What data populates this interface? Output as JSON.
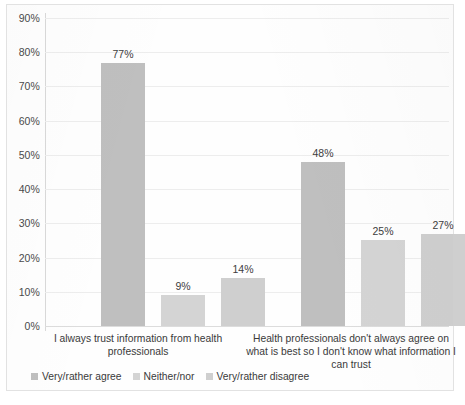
{
  "chart_data": {
    "type": "bar",
    "title": "",
    "xlabel": "",
    "ylabel": "",
    "ylim": [
      0,
      90
    ],
    "ytick_labels": [
      "0%",
      "10%",
      "20%",
      "30%",
      "40%",
      "50%",
      "60%",
      "70%",
      "80%",
      "90%"
    ],
    "ytick_values": [
      0,
      10,
      20,
      30,
      40,
      50,
      60,
      70,
      80,
      90
    ],
    "grid": true,
    "legend_position": "bottom-left",
    "value_label_suffix": "%",
    "categories": [
      "I always trust information from health professionals",
      "Health professionals don't always agree on what is best so I don't know what information I can trust"
    ],
    "series": [
      {
        "name": "Very/rather agree",
        "color": "#bfbfbf",
        "values": [
          77,
          48
        ],
        "value_labels": [
          "77%",
          "48%"
        ]
      },
      {
        "name": "Neither/nor",
        "color": "#d4d4d4",
        "values": [
          9,
          25
        ],
        "value_labels": [
          "9%",
          "25%"
        ]
      },
      {
        "name": "Very/rather disagree",
        "color": "#cfcfcf",
        "values": [
          14,
          27
        ],
        "value_labels": [
          "14%",
          "27%"
        ]
      }
    ]
  },
  "colors": {
    "gridline": "#ededed",
    "axis": "#d9d9d9",
    "text": "#3a3a3a",
    "border": "#e2e2e2",
    "background": "#fefefe"
  }
}
